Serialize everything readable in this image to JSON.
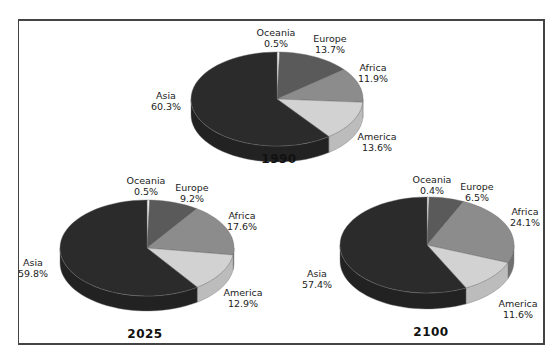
{
  "chart_data": [
    {
      "type": "pie",
      "title": "1990",
      "categories": [
        "Oceania",
        "Europe",
        "Africa",
        "America",
        "Asia"
      ],
      "values": [
        0.5,
        13.7,
        11.9,
        13.6,
        60.3
      ],
      "labels": [
        "0.5%",
        "13.7%",
        "11.9%",
        "13.6%",
        "60.3%"
      ],
      "layout": {
        "cx": 277,
        "cy": 99,
        "rx": 86,
        "ry": 47,
        "depth": 16,
        "title_x": 279,
        "title_y": 152,
        "label_pos": [
          [
            276,
            27
          ],
          [
            330,
            33
          ],
          [
            373,
            62
          ],
          [
            377,
            131
          ],
          [
            166,
            90
          ]
        ]
      }
    },
    {
      "type": "pie",
      "title": "2025",
      "categories": [
        "Oceania",
        "Europe",
        "Africa",
        "America",
        "Asia"
      ],
      "values": [
        0.5,
        9.2,
        17.6,
        12.9,
        59.8
      ],
      "labels": [
        "0.5%",
        "9.2%",
        "17.6%",
        "12.9%",
        "59.8%"
      ],
      "layout": {
        "cx": 147,
        "cy": 248,
        "rx": 87,
        "ry": 48,
        "depth": 15,
        "title_x": 145,
        "title_y": 327,
        "label_pos": [
          [
            146,
            175
          ],
          [
            192,
            182
          ],
          [
            242,
            210
          ],
          [
            243,
            287
          ],
          [
            33,
            257
          ]
        ]
      }
    },
    {
      "type": "pie",
      "title": "2100",
      "categories": [
        "Oceania",
        "Europe",
        "Africa",
        "America",
        "Asia"
      ],
      "values": [
        0.4,
        6.5,
        24.1,
        11.6,
        57.4
      ],
      "labels": [
        "0.4%",
        "6.5%",
        "24.1%",
        "11.6%",
        "57.4%"
      ],
      "layout": {
        "cx": 427,
        "cy": 245,
        "rx": 87,
        "ry": 48,
        "depth": 16,
        "title_x": 431,
        "title_y": 325,
        "label_pos": [
          [
            432,
            174
          ],
          [
            477,
            181
          ],
          [
            525,
            206
          ],
          [
            518,
            298
          ],
          [
            317,
            268
          ]
        ]
      }
    }
  ],
  "colors": {
    "Oceania": "#f2f2f2",
    "Europe": "#5a5a5a",
    "Africa": "#8c8c8c",
    "America": "#d2d2d2",
    "Asia": "#2b2b2b",
    "frame": "#444444"
  },
  "side_colors": {
    "Oceania": "#cccccc",
    "Europe": "#404040",
    "Africa": "#707070",
    "America": "#bcbcbc",
    "Asia": "#222222"
  }
}
